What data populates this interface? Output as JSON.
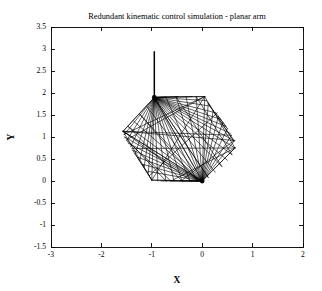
{
  "figure": {
    "title": "Redundant kinematic control simulation - planar arm",
    "background_color": "#ffffff",
    "line_color": "#000000"
  },
  "axes": {
    "xlabel": "X",
    "ylabel": "Y",
    "x_ticks": [
      "-3",
      "-2",
      "-1",
      "0",
      "1",
      "2"
    ],
    "y_ticks": [
      "3.5",
      "3",
      "2.5",
      "2",
      "1.5",
      "1",
      "0.5",
      "0",
      "-0.5",
      "-1",
      "-1.5"
    ]
  },
  "chart_data": {
    "type": "line",
    "title": "Redundant kinematic control simulation - planar arm",
    "xlabel": "X",
    "ylabel": "Y",
    "xlim": [
      -3,
      2
    ],
    "ylim": [
      -1.5,
      3.5
    ],
    "xticks": [
      -3,
      -2,
      -1,
      0,
      1,
      2
    ],
    "yticks": [
      3.5,
      3,
      2.5,
      2,
      1.5,
      1,
      0.5,
      0,
      -0.5,
      -1,
      -1.5
    ],
    "grid": false,
    "legend": null,
    "key_points": {
      "shoulder_hub": [
        -0.95,
        1.9
      ],
      "base_link_top": [
        -0.95,
        2.95
      ],
      "end_effector_hub": [
        0.0,
        0.0
      ],
      "left_extreme": [
        -1.57,
        1.13
      ],
      "right_extreme": [
        0.65,
        0.75
      ],
      "upper_right": [
        0.05,
        1.92
      ],
      "lower_left": [
        -1.0,
        0.0
      ]
    },
    "series": [
      {
        "name": "base link",
        "type": "segment",
        "points": [
          [
            -0.95,
            2.95
          ],
          [
            -0.95,
            1.9
          ]
        ]
      },
      {
        "name": "hub fan from shoulder",
        "type": "fan",
        "origin": [
          -0.95,
          1.9
        ],
        "targets": [
          [
            -1.57,
            1.13
          ],
          [
            -1.55,
            1.05
          ],
          [
            -1.5,
            0.92
          ],
          [
            -1.42,
            0.78
          ],
          [
            -1.33,
            0.62
          ],
          [
            -1.24,
            0.47
          ],
          [
            -1.15,
            0.33
          ],
          [
            -1.07,
            0.18
          ],
          [
            -1.0,
            0.02
          ],
          [
            -0.88,
            0.0
          ],
          [
            -0.72,
            0.0
          ],
          [
            -0.56,
            0.0
          ],
          [
            -0.4,
            0.0
          ],
          [
            -0.24,
            0.0
          ],
          [
            -0.1,
            0.0
          ],
          [
            0.0,
            0.0
          ],
          [
            0.12,
            0.08
          ],
          [
            0.26,
            0.2
          ],
          [
            0.39,
            0.33
          ],
          [
            0.5,
            0.47
          ],
          [
            0.59,
            0.6
          ],
          [
            0.65,
            0.75
          ],
          [
            0.63,
            0.92
          ],
          [
            0.56,
            1.08
          ],
          [
            0.47,
            1.24
          ],
          [
            0.37,
            1.4
          ],
          [
            0.27,
            1.55
          ],
          [
            0.17,
            1.7
          ],
          [
            0.08,
            1.83
          ],
          [
            0.05,
            1.92
          ],
          [
            -0.2,
            1.92
          ],
          [
            -0.48,
            1.92
          ],
          [
            -0.72,
            1.91
          ]
        ]
      },
      {
        "name": "hub fan from end effector",
        "type": "fan",
        "origin": [
          0.0,
          0.0
        ],
        "targets": [
          [
            0.65,
            0.75
          ],
          [
            0.63,
            0.9
          ],
          [
            0.58,
            1.04
          ],
          [
            0.5,
            1.19
          ],
          [
            0.41,
            1.33
          ],
          [
            0.32,
            1.47
          ],
          [
            0.22,
            1.61
          ],
          [
            0.12,
            1.76
          ],
          [
            0.05,
            1.92
          ],
          [
            -0.12,
            1.92
          ],
          [
            -0.32,
            1.92
          ],
          [
            -0.52,
            1.92
          ],
          [
            -0.72,
            1.91
          ],
          [
            -0.95,
            1.9
          ],
          [
            -1.1,
            1.7
          ],
          [
            -1.24,
            1.52
          ],
          [
            -1.36,
            1.36
          ],
          [
            -1.47,
            1.24
          ],
          [
            -1.57,
            1.13
          ],
          [
            -1.54,
            1.0
          ],
          [
            -1.47,
            0.86
          ],
          [
            -1.38,
            0.7
          ],
          [
            -1.28,
            0.54
          ],
          [
            -1.18,
            0.38
          ],
          [
            -1.08,
            0.22
          ],
          [
            -1.0,
            0.02
          ],
          [
            -0.82,
            0.0
          ],
          [
            -0.62,
            0.0
          ],
          [
            -0.42,
            0.0
          ],
          [
            -0.22,
            0.0
          ]
        ]
      },
      {
        "name": "outer boundary polygon",
        "type": "polyline",
        "points": [
          [
            -0.95,
            1.9
          ],
          [
            0.05,
            1.92
          ],
          [
            0.65,
            0.75
          ],
          [
            0.0,
            0.0
          ],
          [
            -1.0,
            0.02
          ],
          [
            -1.57,
            1.13
          ],
          [
            -0.95,
            1.9
          ]
        ]
      },
      {
        "name": "chord sweeps",
        "type": "chords",
        "points": [
          [
            [
              -1.57,
              1.13
            ],
            [
              0.65,
              0.92
            ]
          ],
          [
            [
              -1.57,
              1.13
            ],
            [
              0.58,
              1.04
            ]
          ],
          [
            [
              -1.55,
              1.06
            ],
            [
              0.05,
              1.92
            ]
          ],
          [
            [
              -1.48,
              0.95
            ],
            [
              0.05,
              1.92
            ]
          ],
          [
            [
              -1.0,
              0.02
            ],
            [
              0.05,
              1.92
            ]
          ],
          [
            [
              -1.05,
              0.12
            ],
            [
              0.3,
              1.55
            ]
          ],
          [
            [
              -0.62,
              0.0
            ],
            [
              0.65,
              0.75
            ]
          ],
          [
            [
              -0.42,
              0.0
            ],
            [
              0.63,
              0.92
            ]
          ],
          [
            [
              -1.57,
              1.13
            ],
            [
              0.0,
              0.0
            ]
          ],
          [
            [
              -1.4,
              0.74
            ],
            [
              0.65,
              0.75
            ]
          ]
        ]
      }
    ]
  }
}
